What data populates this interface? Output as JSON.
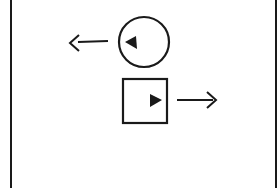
{
  "diagram": {
    "type": "motion-schematic",
    "stroke_color": "#1a1a1a",
    "background": "#ffffff",
    "frame": {
      "left_x": 11,
      "right_x": 276
    },
    "elements": [
      {
        "shape": "circle",
        "marker": "triangle-left",
        "motion_arrow": "left"
      },
      {
        "shape": "square",
        "marker": "triangle-right",
        "motion_arrow": "right"
      }
    ]
  }
}
